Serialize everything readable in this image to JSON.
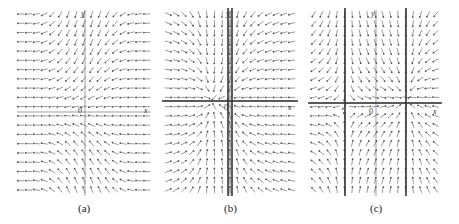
{
  "figure": {
    "panels": [
      {
        "id": "a",
        "caption": "(a)",
        "axis_labels": {
          "x": "x",
          "y": "y",
          "origin": "0"
        },
        "grid": {
          "x0": 21,
          "x1": 147,
          "y0": 14,
          "y1": 190,
          "cols": 17,
          "rows": 20
        },
        "field": "a",
        "axes": {
          "y_axis_x": 85,
          "x_axis_y": 112
        },
        "thick_vertical": [],
        "thick_horizontal": [],
        "label_pos": {
          "y": [
            81,
            10
          ],
          "origin": [
            78,
            107
          ],
          "x": [
            144,
            107
          ],
          "caption": [
            78,
            203
          ]
        }
      },
      {
        "id": "b",
        "caption": "(b)",
        "axis_labels": {
          "x": "x",
          "y": "y",
          "origin": "0"
        },
        "grid": {
          "x0": 168,
          "x1": 292,
          "y0": 14,
          "y1": 190,
          "cols": 17,
          "rows": 20
        },
        "field": "b",
        "axes": {
          "y_axis_x": 230,
          "x_axis_y": 101
        },
        "thick_vertical": [
          228,
          232
        ],
        "thick_horizontal": [
          101
        ],
        "label_pos": {
          "y": [
            226,
            10
          ],
          "origin": [
            224,
            104
          ],
          "x": [
            288,
            104
          ],
          "caption": [
            224,
            203
          ]
        }
      },
      {
        "id": "c",
        "caption": "(c)",
        "axis_labels": {
          "x": "x",
          "y": "y",
          "origin": "0"
        },
        "grid": {
          "x0": 314,
          "x1": 436,
          "y0": 14,
          "y1": 190,
          "cols": 17,
          "rows": 20
        },
        "field": "c",
        "axes": {
          "y_axis_x": 376,
          "x_axis_y": 103
        },
        "thick_vertical": [
          345,
          406
        ],
        "thick_horizontal": [
          103
        ],
        "label_pos": {
          "y": [
            371,
            10
          ],
          "origin": [
            369,
            108
          ],
          "x": [
            433,
            108
          ],
          "caption": [
            370,
            203
          ]
        }
      }
    ],
    "colors": {
      "arrow": "#555555",
      "axis": "#777777",
      "thick": "#333333"
    }
  }
}
